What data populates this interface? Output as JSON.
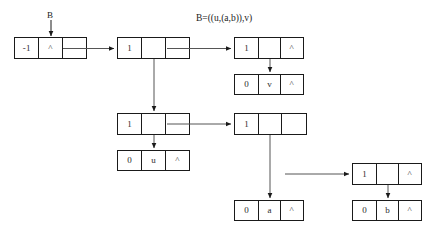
{
  "figure": {
    "title_expression": "B=((u,(a,b)),v)",
    "entry_label": "B",
    "colors": {
      "node_border": "#1a1a1a",
      "wire": "#555555",
      "arrow_dark": "#1a1a1a",
      "background": "#ffffff",
      "text": "#2b2b2b"
    }
  },
  "nodes": [
    {
      "id": "head",
      "name": "head-node",
      "cells": [
        "-1",
        "^",
        ""
      ],
      "note": "list head, tag -1, null left, pointer right"
    },
    {
      "id": "root",
      "name": "root-node",
      "cells": [
        "1",
        "",
        ""
      ],
      "note": "tag 1 branch node, down pointer and right pointer"
    },
    {
      "id": "right-top",
      "name": "right-top-node",
      "cells": [
        "1",
        "",
        "^"
      ],
      "note": "tag 1 branch node, down pointer, null right"
    },
    {
      "id": "leaf-v",
      "name": "leaf-node-v",
      "cells": [
        "0",
        "v",
        "^"
      ],
      "note": "atom v"
    },
    {
      "id": "mid-left",
      "name": "mid-left-node",
      "cells": [
        "1",
        "",
        ""
      ],
      "note": "tag 1 branch node, down pointer and right pointer"
    },
    {
      "id": "leaf-u",
      "name": "leaf-node-u",
      "cells": [
        "0",
        "u",
        "^"
      ],
      "note": "atom u"
    },
    {
      "id": "mid-right",
      "name": "mid-right-node",
      "cells": [
        "1",
        "",
        ""
      ],
      "note": "tag 1 branch node, down pointer and right pointer"
    },
    {
      "id": "leaf-a",
      "name": "leaf-node-a",
      "cells": [
        "0",
        "a",
        "^"
      ],
      "note": "atom a"
    },
    {
      "id": "far-right",
      "name": "far-right-node",
      "cells": [
        "1",
        "",
        "^"
      ],
      "note": "tag 1 branch node, down pointer, null right"
    },
    {
      "id": "leaf-b",
      "name": "leaf-node-b",
      "cells": [
        "0",
        "b",
        "^"
      ],
      "note": "atom b"
    }
  ]
}
